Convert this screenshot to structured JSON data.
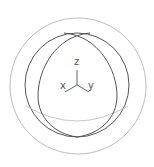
{
  "widget": {
    "type": "orientation-gizmo",
    "colors": {
      "background": "#ffffff",
      "outer_ring": "#bdbdbd",
      "inner_sphere": "#555555",
      "meridians": "#555555",
      "equator": "#c8c8c8",
      "axes": "#666666"
    },
    "axes": {
      "z": {
        "label": "z"
      },
      "x": {
        "label": "x"
      },
      "y": {
        "label": "y"
      }
    }
  }
}
